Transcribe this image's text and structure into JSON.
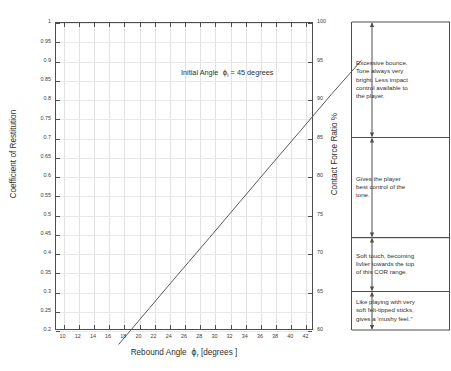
{
  "chart_data": {
    "type": "line",
    "title": "",
    "annotation": "Initial Angle  ϕi = 45 degrees",
    "annotation_parts": {
      "prefix": "Initial Angle",
      "symbol": "ϕ",
      "subscript": "i",
      "suffix": "= 45 degrees"
    },
    "xlabel_parts": {
      "prefix": "Rebound Angle",
      "symbol": "ϕ",
      "subscript": "r",
      "suffix": "[degrees ]"
    },
    "xlabel": "Rebound Angle ϕr [degrees ]",
    "ylabel": "Coefficient of Restitution",
    "y2label": "Contact Force Ratio  %",
    "xlim": [
      9,
      43
    ],
    "ylim": [
      0.2,
      1.0
    ],
    "y2lim": [
      60,
      100
    ],
    "grid": true,
    "legend": null,
    "xticks": [
      10,
      12,
      14,
      16,
      18,
      20,
      22,
      24,
      26,
      28,
      30,
      32,
      34,
      36,
      38,
      40,
      42
    ],
    "xticklabels": [
      "10",
      "12",
      "14",
      "16",
      "18",
      "20",
      "22",
      "24",
      "26",
      "28",
      "30",
      "32",
      "34",
      "36",
      "38",
      "40",
      "42"
    ],
    "yticks": [
      0.2,
      0.25,
      0.3,
      0.35,
      0.4,
      0.45,
      0.5,
      0.55,
      0.6,
      0.65,
      0.7,
      0.75,
      0.8,
      0.85,
      0.9,
      0.95,
      1
    ],
    "yticklabels": [
      "0.2",
      "0.25",
      "0.3",
      "0.35",
      "0.4",
      "0.45",
      "0.5",
      "0.55",
      "0.6",
      "0.65",
      "0.7",
      "0.75",
      "0.8",
      "0.85",
      "0.9",
      "0.95",
      "1"
    ],
    "y2ticks": [
      60,
      65,
      70,
      75,
      80,
      85,
      90,
      95,
      100
    ],
    "y2ticklabels": [
      "60",
      "65",
      "70",
      "75",
      "80",
      "85",
      "90",
      "95",
      "100"
    ],
    "series": [
      {
        "name": "COR vs rebound angle",
        "color": "#5a5a5a",
        "x": [
          10,
          14,
          18,
          22,
          26,
          30,
          34,
          38,
          42
        ],
        "y": [
          0.222,
          0.315,
          0.408,
          0.5,
          0.593,
          0.686,
          0.778,
          0.871,
          0.96
        ]
      }
    ]
  },
  "brackets": [
    {
      "id": "bracket-1",
      "from": 100,
      "to": 85,
      "note": "Excessive bounce.\nTone always very\nbright. Less impact\ncontrol available to\nthe player."
    },
    {
      "id": "bracket-2",
      "from": 85,
      "to": 72,
      "note": "Gives the player\nbest control of the\ntone."
    },
    {
      "id": "bracket-3",
      "from": 72,
      "to": 65,
      "note": "Soft touch, becoming\nlivlier towards the top\nof this COR range."
    },
    {
      "id": "bracket-4",
      "from": 65,
      "to": 60,
      "note": "Like playing with very\nsoft felt-tipped sticks,\ngives a 'mushy feel.\""
    }
  ]
}
